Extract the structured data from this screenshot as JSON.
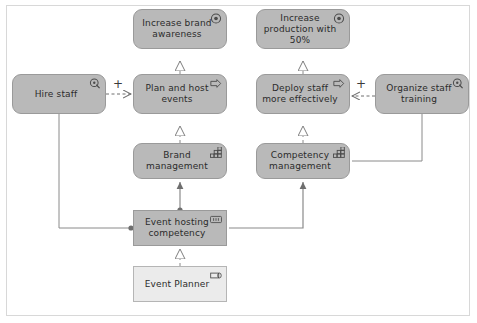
{
  "diagram": {
    "notation": "ArchiMate",
    "canvas": {
      "width": 477,
      "height": 323,
      "background": "#ffffff"
    },
    "colors": {
      "node_fill": "#b9b9b9",
      "node_stroke": "#9a9a9a",
      "node_fill_light": "#ebebeb",
      "node_stroke_light": "#b5b5b5",
      "line": "#8a8a8a",
      "text": "#2b2b2b",
      "frame": "#d8d8d8"
    },
    "nodes": [
      {
        "id": "increase-brand-awareness",
        "label": "Increase brand awareness",
        "type": "goal",
        "icon": "goal-circle-target-icon",
        "shape": "rounded",
        "fill": "#b9b9b9",
        "x": 133,
        "y": 9,
        "w": 94,
        "h": 40
      },
      {
        "id": "increase-production-with-50",
        "label": "Increase production with 50%",
        "type": "goal",
        "icon": "goal-circle-target-icon",
        "shape": "rounded",
        "fill": "#b9b9b9",
        "x": 256,
        "y": 9,
        "w": 94,
        "h": 40
      },
      {
        "id": "hire-staff",
        "label": "Hire staff",
        "type": "course-of-action",
        "icon": "course-of-action-target-arrow-icon",
        "shape": "rounded",
        "fill": "#b9b9b9",
        "x": 12,
        "y": 74,
        "w": 94,
        "h": 40
      },
      {
        "id": "plan-and-host-events",
        "label": "Plan and host events",
        "type": "business-process",
        "icon": "business-process-arrow-icon",
        "shape": "rounded",
        "fill": "#b9b9b9",
        "x": 133,
        "y": 74,
        "w": 94,
        "h": 40
      },
      {
        "id": "deploy-staff-more-effectively",
        "label": "Deploy staff more effectively",
        "type": "business-process",
        "icon": "business-process-arrow-icon",
        "shape": "rounded",
        "fill": "#b9b9b9",
        "x": 256,
        "y": 74,
        "w": 94,
        "h": 40
      },
      {
        "id": "organize-staff-training",
        "label": "Organize staff training",
        "type": "course-of-action",
        "icon": "course-of-action-target-arrow-icon",
        "shape": "rounded",
        "fill": "#b9b9b9",
        "x": 375,
        "y": 74,
        "w": 94,
        "h": 40
      },
      {
        "id": "brand-management",
        "label": "Brand management",
        "type": "capability",
        "icon": "capability-blocks-icon",
        "shape": "rounded",
        "fill": "#b9b9b9",
        "x": 133,
        "y": 143,
        "w": 94,
        "h": 36
      },
      {
        "id": "competency-management",
        "label": "Competency management",
        "type": "capability",
        "icon": "capability-blocks-icon",
        "shape": "rounded",
        "fill": "#b9b9b9",
        "x": 256,
        "y": 143,
        "w": 94,
        "h": 36
      },
      {
        "id": "event-hosting-competency",
        "label": "Event hosting competency",
        "type": "resource",
        "icon": "resource-bars-icon",
        "shape": "sharp",
        "fill": "#b9b9b9",
        "x": 133,
        "y": 210,
        "w": 94,
        "h": 36
      },
      {
        "id": "event-planner",
        "label": "Event Planner",
        "type": "business-role",
        "icon": "business-role-cylinder-icon",
        "shape": "sharp",
        "fill": "#ebebeb",
        "x": 133,
        "y": 266,
        "w": 94,
        "h": 36
      }
    ],
    "edges": [
      {
        "id": "e1",
        "from": "plan-and-host-events",
        "to": "increase-brand-awareness",
        "type": "realization",
        "style": "dashed",
        "head": "hollow-triangle"
      },
      {
        "id": "e2",
        "from": "deploy-staff-more-effectively",
        "to": "increase-production-with-50",
        "type": "realization",
        "style": "dashed",
        "head": "hollow-triangle"
      },
      {
        "id": "e3",
        "from": "brand-management",
        "to": "plan-and-host-events",
        "type": "realization",
        "style": "dashed",
        "head": "hollow-triangle"
      },
      {
        "id": "e4",
        "from": "competency-management",
        "to": "deploy-staff-more-effectively",
        "type": "realization",
        "style": "dashed",
        "head": "hollow-triangle"
      },
      {
        "id": "e5",
        "from": "hire-staff",
        "to": "plan-and-host-events",
        "type": "influence",
        "style": "dashed",
        "head": "open-arrow",
        "label": "+"
      },
      {
        "id": "e6",
        "from": "organize-staff-training",
        "to": "deploy-staff-more-effectively",
        "type": "influence",
        "style": "dashed",
        "head": "open-arrow",
        "label": "+"
      },
      {
        "id": "e7",
        "from": "hire-staff",
        "to": "event-hosting-competency",
        "type": "association",
        "style": "solid",
        "head": "none"
      },
      {
        "id": "e8",
        "from": "event-hosting-competency",
        "to": "brand-management",
        "type": "assignment",
        "style": "solid",
        "head": "filled-arrow"
      },
      {
        "id": "e9",
        "from": "event-hosting-competency",
        "to": "competency-management",
        "type": "assignment",
        "style": "solid",
        "head": "filled-arrow"
      },
      {
        "id": "e10",
        "from": "event-planner",
        "to": "event-hosting-competency",
        "type": "realization",
        "style": "dashed",
        "head": "hollow-triangle"
      },
      {
        "id": "e11",
        "from": "organize-staff-training",
        "to": "competency-management",
        "type": "association",
        "style": "solid",
        "head": "none"
      }
    ],
    "edge_labels": [
      {
        "id": "plus-left",
        "text": "+",
        "x": 113,
        "y": 80
      },
      {
        "id": "plus-right",
        "text": "+",
        "x": 355,
        "y": 80
      }
    ]
  }
}
